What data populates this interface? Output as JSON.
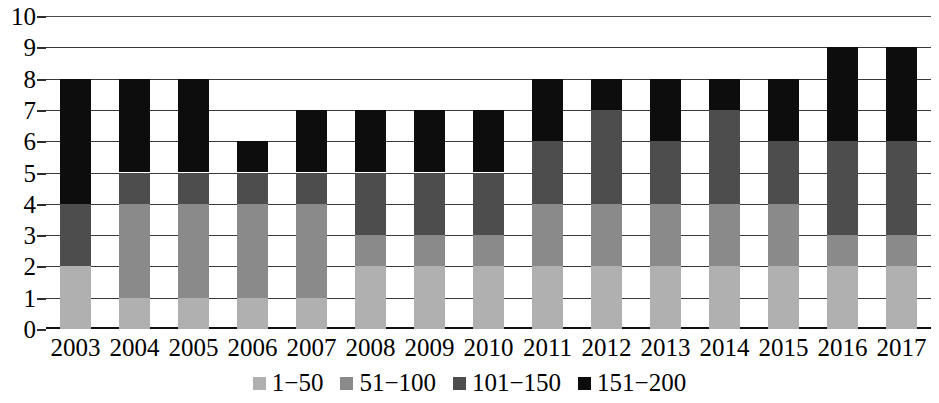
{
  "chart_data": {
    "type": "bar",
    "subtype": "stacked-bar",
    "title": "",
    "xlabel": "",
    "ylabel": "",
    "ylim": [
      0,
      10
    ],
    "ytick_labels": [
      "0",
      "1",
      "2",
      "3",
      "4",
      "5",
      "6",
      "7",
      "8",
      "9",
      "10"
    ],
    "ytick_values": [
      0,
      1,
      2,
      3,
      4,
      5,
      6,
      7,
      8,
      9,
      10
    ],
    "grid": true,
    "legend_position": "bottom-center",
    "categories": [
      "2003",
      "2004",
      "2005",
      "2006",
      "2007",
      "2008",
      "2009",
      "2010",
      "2011",
      "2012",
      "2013",
      "2014",
      "2015",
      "2016",
      "2017"
    ],
    "series": [
      {
        "name": "1−50",
        "color": "#b0b0b0",
        "values": [
          2,
          1,
          1,
          1,
          1,
          2,
          2,
          2,
          2,
          2,
          2,
          2,
          2,
          2,
          2
        ]
      },
      {
        "name": "51−100",
        "color": "#8a8a8a",
        "values": [
          0,
          3,
          3,
          3,
          3,
          1,
          1,
          1,
          2,
          2,
          2,
          2,
          2,
          1,
          1
        ]
      },
      {
        "name": "101−150",
        "color": "#4d4d4d",
        "values": [
          2,
          1,
          1,
          1,
          1,
          2,
          2,
          2,
          2,
          3,
          2,
          3,
          2,
          3,
          3
        ]
      },
      {
        "name": "151−200",
        "color": "#0d0d0d",
        "values": [
          4,
          3,
          3,
          1,
          2,
          2,
          2,
          2,
          2,
          1,
          2,
          1,
          2,
          3,
          3
        ]
      }
    ],
    "totals": [
      8,
      8,
      8,
      6,
      7,
      7,
      7,
      7,
      8,
      8,
      8,
      8,
      8,
      9,
      9
    ]
  },
  "legend": {
    "items": [
      {
        "label": "1−50",
        "color": "#b0b0b0"
      },
      {
        "label": "51−100",
        "color": "#8a8a8a"
      },
      {
        "label": "101−150",
        "color": "#4d4d4d"
      },
      {
        "label": "151−200",
        "color": "#0d0d0d"
      }
    ]
  },
  "axis": {
    "background": "#ffffff",
    "gridline_color": "#3a3a3a",
    "baseline_color": "#111111"
  }
}
